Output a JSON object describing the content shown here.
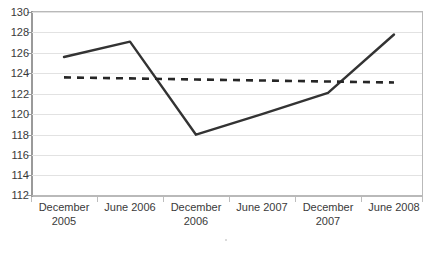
{
  "chart_data": {
    "type": "line",
    "title": "",
    "xlabel": "",
    "ylabel": "",
    "categories": [
      "December 2005",
      "June 2006",
      "December 2006",
      "June 2007",
      "December 2007",
      "June 2008"
    ],
    "category_lines": [
      [
        "December",
        "2005"
      ],
      [
        "June 2006",
        ""
      ],
      [
        "December",
        "2006"
      ],
      [
        "June 2007",
        ""
      ],
      [
        "December",
        "2007"
      ],
      [
        "June 2008",
        ""
      ]
    ],
    "ylim": [
      112,
      130
    ],
    "ytick_step": 2,
    "ytick_labels": [
      "130",
      "128",
      "126",
      "124",
      "122",
      "120",
      "118",
      "116",
      "114",
      "112"
    ],
    "grid": true,
    "legend": "none",
    "series": [
      {
        "name": "solid-series",
        "style": "solid",
        "color": "#333333",
        "values": [
          125.6,
          127.1,
          118.0,
          120.0,
          122.1,
          127.8
        ]
      },
      {
        "name": "dashed-series",
        "style": "dashed",
        "color": "#262626",
        "values": [
          123.6,
          123.5,
          123.4,
          123.3,
          123.2,
          123.1
        ]
      }
    ]
  },
  "colors": {
    "background": "#ffffff",
    "gridline": "#e2e2e2",
    "frame": "#b9b9b9",
    "axis": "#9a9a9a",
    "solid_series": "#333333",
    "dashed_series": "#262626",
    "text": "#3a3a3a"
  }
}
